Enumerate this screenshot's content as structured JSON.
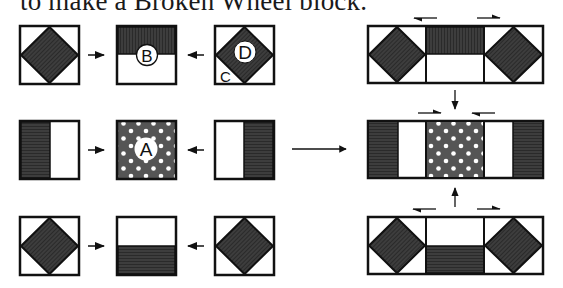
{
  "title": "to make a Broken Wheel block.",
  "colors": {
    "outline": "#111111",
    "dark_fabric": "#3a3a3a",
    "dotted_fabric": "#555555",
    "dot": "#ffffff",
    "background": "#ffffff"
  },
  "labels": {
    "A": "A",
    "B": "B",
    "C": "C",
    "D": "D"
  },
  "left_grid": {
    "rows": [
      {
        "blocks": [
          "square-in-square",
          "half-dark-top (B)",
          "square-in-square (D, C)"
        ]
      },
      {
        "blocks": [
          "half-dark-left",
          "dotted-center (A)",
          "half-dark-right"
        ]
      },
      {
        "blocks": [
          "square-in-square",
          "half-dark-bottom",
          "square-in-square"
        ]
      }
    ]
  },
  "right_assembly": {
    "rows": [
      {
        "blocks": [
          "square-in-square",
          "half-dark-top",
          "square-in-square"
        ]
      },
      {
        "blocks": [
          "half-dark-left",
          "dotted-center",
          "half-dark-right"
        ]
      },
      {
        "blocks": [
          "square-in-square",
          "half-dark-bottom",
          "square-in-square"
        ]
      }
    ]
  }
}
